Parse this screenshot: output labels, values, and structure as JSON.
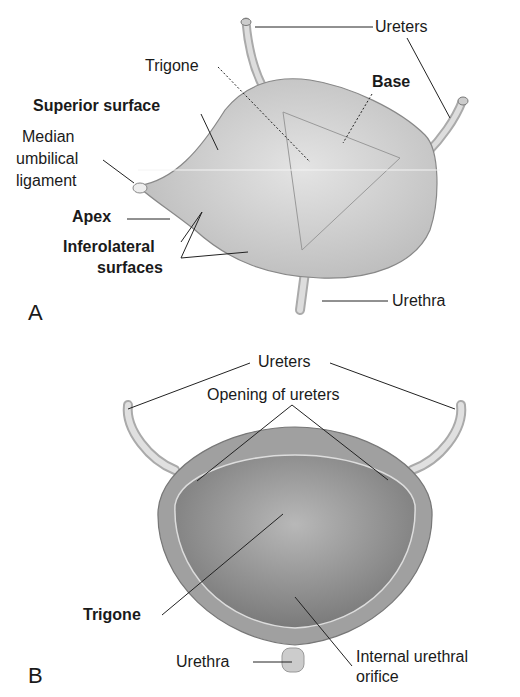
{
  "panel_a": {
    "letter": "A",
    "labels": {
      "ureters": "Ureters",
      "trigone": "Trigone",
      "base": "Base",
      "superior_surface": "Superior surface",
      "median_umbilical_1": "Median",
      "median_umbilical_2": "umbilical",
      "median_umbilical_3": "ligament",
      "apex": "Apex",
      "inferolateral_1": "Inferolateral",
      "inferolateral_2": "surfaces",
      "urethra": "Urethra"
    }
  },
  "panel_b": {
    "letter": "B",
    "labels": {
      "ureters": "Ureters",
      "opening_of_ureters": "Opening of ureters",
      "trigone": "Trigone",
      "urethra": "Urethra",
      "internal_orifice_1": "Internal urethral",
      "internal_orifice_2": "orifice"
    }
  }
}
